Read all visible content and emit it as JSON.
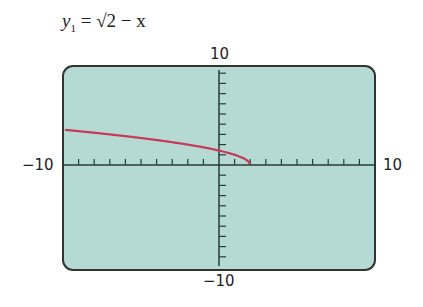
{
  "equation": {
    "lhs": "y",
    "sub": "1",
    "rhs": "= √2 − x"
  },
  "window": {
    "xmin": "−10",
    "xmax": "10",
    "ymin": "−10",
    "ymax": "10"
  },
  "colors": {
    "screen": "#b5dad4",
    "curve": "#c8385a",
    "frame": "#333333"
  },
  "chart_data": {
    "type": "line",
    "xlabel": "",
    "ylabel": "",
    "xlim": [
      -10,
      10
    ],
    "ylim": [
      -10,
      10
    ],
    "x": [
      -10,
      -8,
      -6,
      -4,
      -2,
      0,
      1,
      1.5,
      2
    ],
    "series": [
      {
        "name": "y1",
        "values": [
          3.46,
          3.16,
          2.83,
          2.45,
          2.0,
          1.41,
          1.0,
          0.71,
          0.0
        ]
      }
    ],
    "grid": false,
    "tick_step": 1
  }
}
